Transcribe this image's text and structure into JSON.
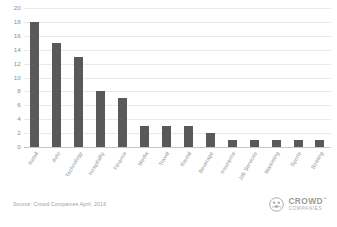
{
  "chart_data": {
    "type": "bar",
    "title": "",
    "subtitle": "",
    "xlabel": "",
    "ylabel": "",
    "ylim": [
      0,
      20
    ],
    "yticks": [
      0,
      2,
      4,
      6,
      8,
      10,
      12,
      14,
      16,
      18,
      20
    ],
    "grid": true,
    "legend": "none",
    "orientation": "vertical",
    "bar_color": "#595959",
    "gridline_color": "#e9e9e9",
    "categories": [
      "Retail",
      "Auto",
      "Technology",
      "Hospitality",
      "Finance",
      "Media",
      "Travel",
      "Rental",
      "Beverage",
      "Insurance",
      "Job Services",
      "Marketing",
      "Sports",
      "Boating"
    ],
    "values": [
      18,
      15,
      13,
      8,
      7,
      3,
      3,
      3,
      2,
      1,
      1,
      1,
      1,
      1
    ]
  },
  "footer": {
    "source": "Source: Crowd Companies April, 2016",
    "brand_name": "CROWD",
    "brand_tm": "™",
    "brand_sub": "COMPANIES",
    "brand_icon": "crowd-companies-logo-icon"
  }
}
